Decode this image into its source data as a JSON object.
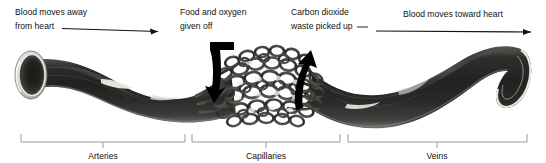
{
  "figure": {
    "annotations": {
      "left_flow": {
        "line1": "Blood moves away",
        "line2": "from heart",
        "icon": "arrow-right-icon"
      },
      "food_oxygen": {
        "line1": "Food and oxygen",
        "line2": "given off",
        "icon": "down-hook-arrow-icon"
      },
      "carbon_dioxide": {
        "line1": "Carbon dioxide",
        "line2": "waste picked up",
        "icon": "up-hook-arrow-icon"
      },
      "right_flow": {
        "line1": "Blood moves toward heart",
        "icon": "arrow-right-icon"
      }
    },
    "sections": [
      {
        "id": "arteries",
        "label": "Arteries"
      },
      {
        "id": "capillaries",
        "label": "Capillaries"
      },
      {
        "id": "veins",
        "label": "Veins"
      }
    ],
    "colors": {
      "vessel_dark": "#2b2b2b",
      "vessel_mid": "#4a4a4a",
      "vessel_light": "#d8d6d2",
      "highlight": "#f2f0ec",
      "bracket": "#9a9a9a",
      "text": "#111111",
      "background": "#ffffff",
      "arrow_black": "#000000"
    }
  }
}
